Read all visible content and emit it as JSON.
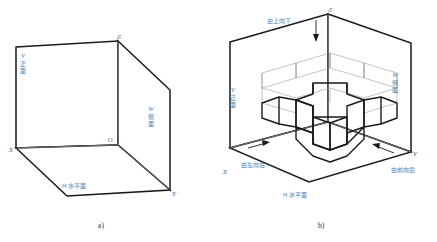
{
  "figure": {
    "background": "#ffffff",
    "ink_heavy": "#1a1a1a",
    "ink_light": "#8a8a8a",
    "label_color": "#4a7fb5",
    "caption_color": "#33322f",
    "width": 437,
    "height": 242
  },
  "panel_a": {
    "caption": "a)",
    "axes": {
      "z": "Z",
      "x": "X",
      "y": "Y",
      "origin": "O"
    },
    "planes": [
      {
        "id": "V",
        "letter": "V",
        "name": "正面",
        "full": "V 正面"
      },
      {
        "id": "W",
        "letter": "W",
        "name": "侧面",
        "full": "W 侧面"
      },
      {
        "id": "H",
        "letter": "H",
        "name": "水平面",
        "full": "H 水平面"
      }
    ]
  },
  "panel_b": {
    "caption": "b)",
    "axes": {
      "z": "Z",
      "x": "X",
      "y": "Y"
    },
    "planes": [
      {
        "id": "V",
        "letter": "V",
        "name": "正面",
        "full": "V 正面"
      },
      {
        "id": "W",
        "letter": "W",
        "name": "侧面",
        "full": "W 侧面"
      },
      {
        "id": "H",
        "letter": "H",
        "name": "水平面",
        "full": "H 水平面"
      }
    ],
    "projection_directions": [
      {
        "id": "top-down",
        "label": "由上向下"
      },
      {
        "id": "left-right",
        "label": "由左向右"
      },
      {
        "id": "front-back",
        "label": "由前向后"
      }
    ],
    "object": "cross-shaped-solid"
  }
}
